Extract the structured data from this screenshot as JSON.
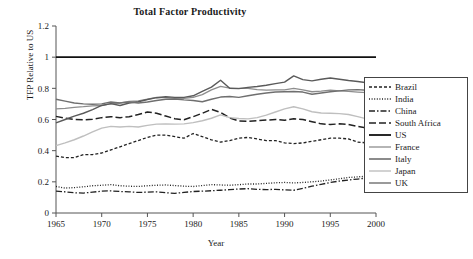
{
  "chart_data": {
    "type": "line",
    "title": "Total Factor Productivity",
    "xlabel": "Year",
    "ylabel": "TFP Relative to US",
    "xlim": [
      1965,
      2000
    ],
    "ylim": [
      0,
      1.2
    ],
    "xticks": [
      "1965",
      "1970",
      "1975",
      "1980",
      "1985",
      "1990",
      "1995",
      "2000"
    ],
    "yticks": [
      "0",
      "0.2",
      "0.4",
      "0.6",
      "0.8",
      "1",
      "1.2"
    ],
    "grid": false,
    "legend_position": "right-outside",
    "x": [
      1965,
      1966,
      1967,
      1968,
      1969,
      1970,
      1971,
      1972,
      1973,
      1974,
      1975,
      1976,
      1977,
      1978,
      1979,
      1980,
      1981,
      1982,
      1983,
      1984,
      1985,
      1986,
      1987,
      1988,
      1989,
      1990,
      1991,
      1992,
      1993,
      1994,
      1995,
      1996,
      1997,
      1998,
      1999,
      2000
    ],
    "series": [
      {
        "name": "Brazil",
        "style": "dashed-fine",
        "color": "#222222",
        "width": 1.3,
        "dash": "3,2",
        "values": [
          0.365,
          0.355,
          0.355,
          0.375,
          0.375,
          0.385,
          0.405,
          0.425,
          0.445,
          0.465,
          0.485,
          0.5,
          0.5,
          0.49,
          0.48,
          0.51,
          0.49,
          0.47,
          0.455,
          0.465,
          0.48,
          0.485,
          0.475,
          0.465,
          0.465,
          0.45,
          0.445,
          0.45,
          0.46,
          0.47,
          0.48,
          0.48,
          0.475,
          0.455,
          0.45,
          0.455
        ]
      },
      {
        "name": "India",
        "style": "dotted",
        "color": "#222222",
        "width": 1.3,
        "dash": "1,1.6",
        "values": [
          0.17,
          0.16,
          0.163,
          0.168,
          0.175,
          0.178,
          0.182,
          0.175,
          0.172,
          0.17,
          0.175,
          0.178,
          0.18,
          0.176,
          0.172,
          0.17,
          0.176,
          0.182,
          0.18,
          0.178,
          0.182,
          0.186,
          0.186,
          0.19,
          0.194,
          0.196,
          0.193,
          0.196,
          0.2,
          0.205,
          0.212,
          0.22,
          0.228,
          0.232,
          0.236,
          0.24
        ]
      },
      {
        "name": "China",
        "style": "dash-dot",
        "color": "#222222",
        "width": 1.3,
        "dash": "6,2,1.5,2",
        "values": [
          0.14,
          0.136,
          0.13,
          0.128,
          0.134,
          0.14,
          0.142,
          0.138,
          0.136,
          0.132,
          0.134,
          0.136,
          0.13,
          0.126,
          0.132,
          0.138,
          0.14,
          0.143,
          0.146,
          0.15,
          0.154,
          0.156,
          0.152,
          0.15,
          0.152,
          0.148,
          0.146,
          0.158,
          0.172,
          0.184,
          0.196,
          0.205,
          0.212,
          0.218,
          0.224,
          0.23
        ]
      },
      {
        "name": "South Africa",
        "style": "dashed",
        "color": "#222222",
        "width": 1.5,
        "dash": "7,3",
        "values": [
          0.62,
          0.608,
          0.6,
          0.598,
          0.602,
          0.612,
          0.618,
          0.612,
          0.618,
          0.632,
          0.648,
          0.64,
          0.622,
          0.605,
          0.598,
          0.618,
          0.64,
          0.665,
          0.645,
          0.61,
          0.59,
          0.588,
          0.592,
          0.596,
          0.6,
          0.595,
          0.605,
          0.6,
          0.586,
          0.572,
          0.568,
          0.572,
          0.568,
          0.556,
          0.546,
          0.54
        ]
      },
      {
        "name": "US",
        "style": "solid",
        "color": "#111111",
        "width": 1.8,
        "dash": "none",
        "values": [
          1.0,
          1.0,
          1.0,
          1.0,
          1.0,
          1.0,
          1.0,
          1.0,
          1.0,
          1.0,
          1.0,
          1.0,
          1.0,
          1.0,
          1.0,
          1.0,
          1.0,
          1.0,
          1.0,
          1.0,
          1.0,
          1.0,
          1.0,
          1.0,
          1.0,
          1.0,
          1.0,
          1.0,
          1.0,
          1.0,
          1.0,
          1.0,
          1.0,
          1.0,
          1.0,
          1.0
        ]
      },
      {
        "name": "France",
        "style": "solid",
        "color": "#8d8d8d",
        "width": 1.3,
        "dash": "none",
        "values": [
          0.668,
          0.672,
          0.678,
          0.682,
          0.688,
          0.69,
          0.7,
          0.706,
          0.716,
          0.72,
          0.73,
          0.742,
          0.74,
          0.736,
          0.736,
          0.742,
          0.76,
          0.79,
          0.812,
          0.802,
          0.8,
          0.8,
          0.792,
          0.788,
          0.79,
          0.79,
          0.8,
          0.79,
          0.778,
          0.782,
          0.788,
          0.784,
          0.78,
          0.776,
          0.772,
          0.77
        ]
      },
      {
        "name": "Italy",
        "style": "solid",
        "color": "#5a5a5a",
        "width": 1.4,
        "dash": "none",
        "values": [
          0.578,
          0.6,
          0.622,
          0.64,
          0.664,
          0.69,
          0.702,
          0.69,
          0.706,
          0.714,
          0.728,
          0.74,
          0.746,
          0.742,
          0.742,
          0.752,
          0.78,
          0.808,
          0.852,
          0.8,
          0.798,
          0.806,
          0.812,
          0.82,
          0.83,
          0.84,
          0.88,
          0.856,
          0.848,
          0.858,
          0.866,
          0.858,
          0.85,
          0.844,
          0.836,
          0.83
        ]
      },
      {
        "name": "Japan",
        "style": "solid",
        "color": "#bfbfbf",
        "width": 1.4,
        "dash": "none",
        "values": [
          0.432,
          0.45,
          0.47,
          0.494,
          0.52,
          0.545,
          0.556,
          0.552,
          0.556,
          0.552,
          0.562,
          0.57,
          0.572,
          0.57,
          0.572,
          0.58,
          0.592,
          0.608,
          0.63,
          0.612,
          0.606,
          0.604,
          0.612,
          0.628,
          0.648,
          0.668,
          0.682,
          0.668,
          0.65,
          0.642,
          0.64,
          0.638,
          0.632,
          0.618,
          0.604,
          0.598
        ]
      },
      {
        "name": "UK",
        "style": "solid",
        "color": "#6f6f6f",
        "width": 1.4,
        "dash": "none",
        "values": [
          0.73,
          0.718,
          0.706,
          0.7,
          0.698,
          0.7,
          0.712,
          0.706,
          0.712,
          0.706,
          0.712,
          0.722,
          0.73,
          0.732,
          0.726,
          0.722,
          0.714,
          0.73,
          0.744,
          0.748,
          0.742,
          0.752,
          0.762,
          0.77,
          0.776,
          0.778,
          0.78,
          0.776,
          0.762,
          0.77,
          0.778,
          0.784,
          0.79,
          0.792,
          0.788,
          0.776
        ]
      }
    ]
  }
}
